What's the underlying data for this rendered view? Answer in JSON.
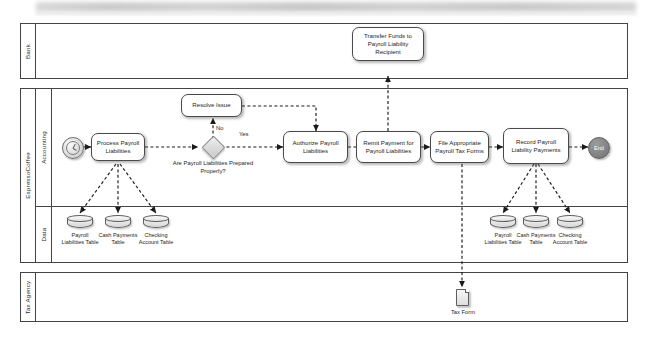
{
  "diagram": {
    "type": "bpmn-cross-functional-flowchart"
  },
  "pools": [
    {
      "name": "Bank",
      "label": "Bank"
    },
    {
      "name": "EspressoCoffee",
      "label": "EspressoCoffee"
    },
    {
      "name": "TaxAgency",
      "label": "Tax Agency"
    }
  ],
  "lanes": [
    {
      "label": "Accounting"
    },
    {
      "label": "Data"
    }
  ],
  "events": {
    "start": {
      "icon": "clock-icon",
      "label": ""
    },
    "end": {
      "label": "End"
    }
  },
  "tasks": {
    "transfer_funds": "Transfer Funds to Payroll Liability Recipient",
    "resolve_issue": "Resolve Issue",
    "process_payroll": "Process Payroll Liabilities",
    "authorize": "Authorize Payroll Liabilities",
    "remit_payment": "Remit Payment for Payroll Liabilities",
    "file_tax_forms": "File Appropriate Payroll Tax Forms",
    "record_payments": "Record Payroll Liability Payments"
  },
  "gateway": {
    "question": "Are Payroll Liabilities Prepared Properly?",
    "branch_no": "No",
    "branch_yes": "Yes"
  },
  "datastores_left": [
    {
      "label": "Payroll Liabilities Table"
    },
    {
      "label": "Cash Payments Table"
    },
    {
      "label": "Checking Account Table"
    }
  ],
  "datastores_right": [
    {
      "label": "Payroll Liabilities Table"
    },
    {
      "label": "Cash Payments Table"
    },
    {
      "label": "Checking Account Table"
    }
  ],
  "artifacts": {
    "tax_form": "Tax Form"
  },
  "colors": {
    "border": "#444444",
    "task_border": "#4a4a4a",
    "end_fill": "#7e7e7e",
    "gateway_fill": "#d4d4d4",
    "background": "#ffffff"
  }
}
